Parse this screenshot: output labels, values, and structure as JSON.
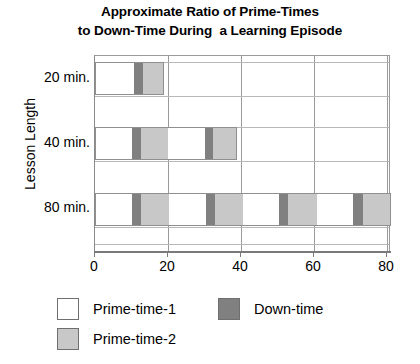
{
  "chart_data": {
    "type": "bar",
    "orientation": "horizontal",
    "stacked": true,
    "title": "Approximate Ratio of Prime-Times to Down-Time During  a Learning Episode",
    "title_line1": "Approximate Ratio of Prime-Times",
    "title_line2": "to Down-Time During  a Learning Episode",
    "xlabel": "",
    "ylabel": "Lesson Length",
    "categories": [
      "20 min.",
      "40 min.",
      "80 min."
    ],
    "xlim": [
      0,
      81
    ],
    "xticks": [
      0,
      20,
      40,
      60,
      80
    ],
    "xtick_labels": [
      "0",
      "20",
      "40",
      "60",
      "80"
    ],
    "grid": "vertical",
    "legend_position": "bottom",
    "legend": [
      {
        "name": "Prime-time-1",
        "color": "#ffffff"
      },
      {
        "name": "Down-time",
        "color": "#808080"
      },
      {
        "name": "Prime-time-2",
        "color": "#c8c8c8"
      }
    ],
    "bars": [
      {
        "category": "20 min.",
        "total": 19,
        "segments": [
          {
            "series": "Prime-time-1",
            "start": 0,
            "end": 10.7,
            "value": 10.7
          },
          {
            "series": "Down-time",
            "start": 10.7,
            "end": 13.2,
            "value": 2.5
          },
          {
            "series": "Prime-time-2",
            "start": 13.2,
            "end": 19.0,
            "value": 5.8
          }
        ]
      },
      {
        "category": "40 min.",
        "total": 39,
        "segments": [
          {
            "series": "Prime-time-1",
            "start": 0,
            "end": 10.1,
            "value": 10.1
          },
          {
            "series": "Down-time",
            "start": 10.1,
            "end": 12.6,
            "value": 2.5
          },
          {
            "series": "Prime-time-2",
            "start": 12.6,
            "end": 20.0,
            "value": 7.4
          },
          {
            "series": "Prime-time-1",
            "start": 20.0,
            "end": 30.1,
            "value": 10.1
          },
          {
            "series": "Down-time",
            "start": 30.1,
            "end": 32.3,
            "value": 2.2
          },
          {
            "series": "Prime-time-2",
            "start": 32.3,
            "end": 39.0,
            "value": 6.7
          }
        ]
      },
      {
        "category": "80 min.",
        "total": 81,
        "segments": [
          {
            "series": "Prime-time-1",
            "start": 0,
            "end": 10.1,
            "value": 10.1
          },
          {
            "series": "Down-time",
            "start": 10.1,
            "end": 12.6,
            "value": 2.5
          },
          {
            "series": "Prime-time-2",
            "start": 12.6,
            "end": 20.3,
            "value": 7.7
          },
          {
            "series": "Prime-time-1",
            "start": 20.3,
            "end": 30.4,
            "value": 10.1
          },
          {
            "series": "Down-time",
            "start": 30.4,
            "end": 33.0,
            "value": 2.6
          },
          {
            "series": "Prime-time-2",
            "start": 33.0,
            "end": 40.5,
            "value": 7.5
          },
          {
            "series": "Prime-time-1",
            "start": 40.5,
            "end": 50.5,
            "value": 10.0
          },
          {
            "series": "Down-time",
            "start": 50.5,
            "end": 53.0,
            "value": 2.5
          },
          {
            "series": "Prime-time-2",
            "start": 53.0,
            "end": 60.8,
            "value": 7.8
          },
          {
            "series": "Prime-time-1",
            "start": 60.8,
            "end": 70.8,
            "value": 10.0
          },
          {
            "series": "Down-time",
            "start": 70.8,
            "end": 73.3,
            "value": 2.5
          },
          {
            "series": "Prime-time-2",
            "start": 73.3,
            "end": 81.0,
            "value": 7.7
          }
        ]
      }
    ]
  }
}
